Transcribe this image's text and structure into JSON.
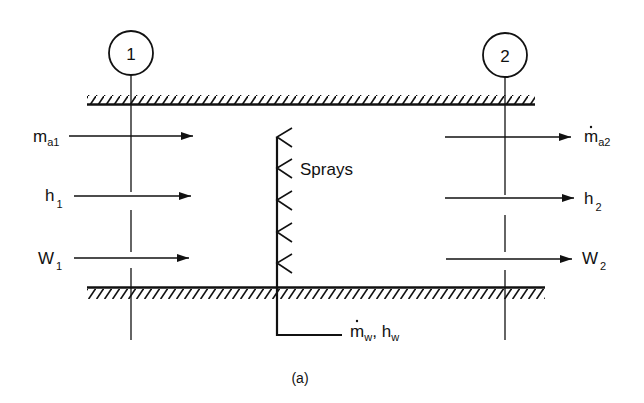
{
  "figure": {
    "caption": "(a)",
    "ink_color": "#111111",
    "background": "#ffffff"
  },
  "sections": [
    {
      "id": "section-1",
      "number": "1"
    },
    {
      "id": "section-2",
      "number": "2"
    }
  ],
  "sprays": {
    "label": "Sprays",
    "count": 5
  },
  "inlet": {
    "mass_flow": {
      "base": "m",
      "sub": "a1",
      "dot": false
    },
    "enthalpy": {
      "base": "h",
      "sub": "1"
    },
    "humidity": {
      "base": "W",
      "sub": "1"
    }
  },
  "outlet": {
    "mass_flow": {
      "base": "m",
      "sub": "a2",
      "dot": true
    },
    "enthalpy": {
      "base": "h",
      "sub": "2"
    },
    "humidity": {
      "base": "W",
      "sub": "2"
    }
  },
  "water_supply": {
    "mass_flow": {
      "base": "m",
      "sub": "w",
      "dot": true
    },
    "separator": ",",
    "enthalpy": {
      "base": "h",
      "sub": "w"
    }
  }
}
